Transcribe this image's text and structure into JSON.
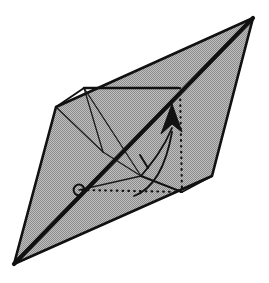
{
  "figure": {
    "title": "Rotation axis diagram of a bipyramidal polyhedron",
    "type": "geometric-line-diagram",
    "canvas": {
      "width": 269,
      "height": 283,
      "background": "#ffffff"
    },
    "colors": {
      "fill_gray": "#a9a9a9",
      "stroke_dark": "#111111",
      "stroke_thin": "#1a1a1a",
      "dotted": "#111111",
      "background": "#ffffff"
    },
    "stroke_widths": {
      "outer_outline": 2.6,
      "axis_bold": 4.2,
      "inner_edge": 1.9,
      "thin_edge": 1.3,
      "dotted": 2.2,
      "arc": 1.8
    },
    "outer_body": {
      "name": "outer-bipyramid-silhouette",
      "points": "253,18 212,176 14,264 56,107",
      "fill": "#a9a9a9",
      "stroke": "#111111"
    },
    "inner_solid": {
      "name": "inner-polyhedron",
      "top_left_vertex": "84,88",
      "top_right_vertex": "178,88",
      "bottom_right_vertex": "182,192",
      "bottom_left_vertex": "79,190",
      "mid_left_vertex": "103,152",
      "mid_bottom_vertex": "141,176"
    },
    "edges": [
      {
        "name": "inner-edge-top",
        "d": "M84,88 L178,88",
        "style": "solid-bold"
      },
      {
        "name": "inner-edge-left-upper",
        "d": "M56,107 L84,88",
        "style": "solid"
      },
      {
        "name": "inner-edge-left-lower",
        "d": "M56,107 L103,152",
        "style": "thin"
      },
      {
        "name": "inner-edge-tl-to-mid",
        "d": "M84,88 L103,152",
        "style": "thin"
      },
      {
        "name": "inner-edge-tl-to-midbottom",
        "d": "M84,88 L141,176",
        "style": "thin"
      },
      {
        "name": "inner-edge-mid-to-midbottom",
        "d": "M103,152 L141,176",
        "style": "thin"
      },
      {
        "name": "inner-edge-midbottom-to-br",
        "d": "M141,176 L182,192",
        "style": "solid"
      },
      {
        "name": "inner-edge-br-to-right",
        "d": "M182,192 L212,176",
        "style": "solid"
      },
      {
        "name": "inner-edge-bl-to-midbottom",
        "d": "M79,190 L141,176",
        "style": "thin"
      }
    ],
    "axis": {
      "name": "rotation-axis",
      "d": "M14,264 L253,18",
      "style": "solid-bold",
      "description": "principal diagonal axis through the solid"
    },
    "arrow": {
      "name": "rotation-arrow-head",
      "tip": "172,104",
      "left": "161,134",
      "right": "182,132",
      "notch": "172,124",
      "tail_d": "M172,128 C163,150 150,165 141,176",
      "direction": "upward"
    },
    "dotted_lines": [
      {
        "name": "dotted-vertical-construction",
        "d": "M180,88 L182,192"
      },
      {
        "name": "dotted-horizontal-construction",
        "d": "M82,190 L182,192"
      }
    ],
    "marker": {
      "name": "origin-circle-marker",
      "cx": 79,
      "cy": 190,
      "r": 5.4,
      "fill": "none",
      "stroke": "#111111"
    },
    "angle_arc": {
      "name": "rotation-angle-arc",
      "d": "M134,196 C150,190 165,172 172,132",
      "tick_d": "M140,155 L148,168",
      "description": "arc indicating rotation about the axis with a tick mark"
    }
  }
}
